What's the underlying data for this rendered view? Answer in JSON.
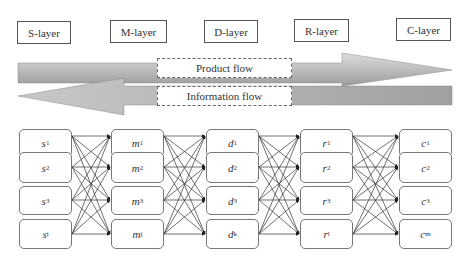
{
  "layers": [
    {
      "id": "S",
      "label": "S-layer"
    },
    {
      "id": "M",
      "label": "M-layer"
    },
    {
      "id": "D",
      "label": "D-layer"
    },
    {
      "id": "R",
      "label": "R-layer"
    },
    {
      "id": "C",
      "label": "C-layer"
    }
  ],
  "flows": {
    "product": {
      "label": "Product flow",
      "direction": "right"
    },
    "information": {
      "label": "Information flow",
      "direction": "left"
    }
  },
  "nodes": {
    "S": [
      {
        "base": "s",
        "sub": "1"
      },
      {
        "base": "s",
        "sub": "2"
      },
      {
        "base": "s",
        "sub": "3"
      },
      {
        "base": "s",
        "sub": "i"
      }
    ],
    "M": [
      {
        "base": "m",
        "sub": "1"
      },
      {
        "base": "m",
        "sub": "2"
      },
      {
        "base": "m",
        "sub": "3"
      },
      {
        "base": "m",
        "sub": "j"
      }
    ],
    "D": [
      {
        "base": "d",
        "sub": "1"
      },
      {
        "base": "d",
        "sub": "2"
      },
      {
        "base": "d",
        "sub": "3"
      },
      {
        "base": "d",
        "sub": "k"
      }
    ],
    "R": [
      {
        "base": "r",
        "sub": "1"
      },
      {
        "base": "r",
        "sub": "2"
      },
      {
        "base": "r",
        "sub": "3"
      },
      {
        "base": "r",
        "sub": "l"
      }
    ],
    "C": [
      {
        "base": "c",
        "sub": "1"
      },
      {
        "base": "c",
        "sub": "2"
      },
      {
        "base": "c",
        "sub": "3"
      },
      {
        "base": "c",
        "sub": "m"
      }
    ]
  },
  "connections": "fully connected between adjacent layers (S→M, M→D, D→R, R→C)",
  "colors": {
    "arrow_light": "#d8d8d8",
    "arrow_dark": "#9a9a9a",
    "border": "#555555",
    "text": "#333333"
  }
}
